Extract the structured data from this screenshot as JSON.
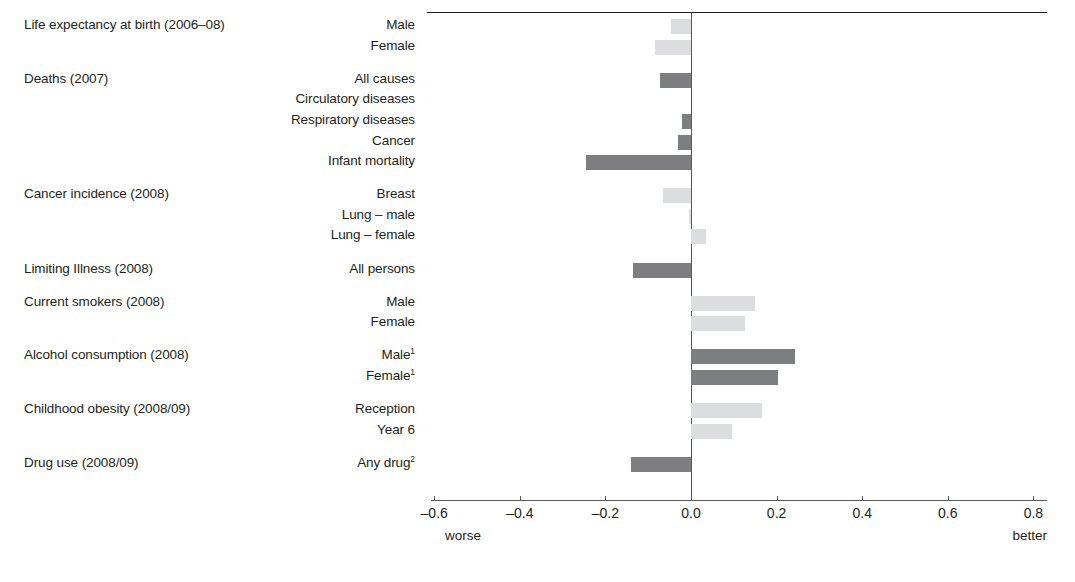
{
  "chart_data": {
    "type": "bar",
    "orientation": "horizontal",
    "title": "",
    "xlabel": "",
    "ylabel": "",
    "xlim": [
      -0.6,
      0.8
    ],
    "xticks": [
      -0.6,
      -0.4,
      -0.2,
      0.0,
      0.2,
      0.4,
      0.6,
      0.8
    ],
    "xtick_labels": [
      "–0.6",
      "–0.4",
      "–0.2",
      "0.0",
      "0.2",
      "0.4",
      "0.6",
      "0.8"
    ],
    "grid": false,
    "legend": null,
    "axis_end_labels": {
      "left": "worse",
      "right": "better"
    },
    "colors": {
      "dark": "#7d7e80",
      "light": "#dcdddf",
      "zero_line": "#58595b",
      "axis": "#58595b",
      "text": "#231f20"
    },
    "groups": [
      {
        "label": "Life expectancy at birth (2006–08)",
        "items": [
          {
            "label": "Male",
            "value": -0.047,
            "shade": "light"
          },
          {
            "label": "Female",
            "value": -0.084,
            "shade": "light"
          }
        ]
      },
      {
        "label": "Deaths (2007)",
        "items": [
          {
            "label": "All causes",
            "value": -0.072,
            "shade": "dark"
          },
          {
            "label": "Circulatory diseases",
            "value": 0.0,
            "shade": "dark"
          },
          {
            "label": "Respiratory diseases",
            "value": -0.021,
            "shade": "dark"
          },
          {
            "label": "Cancer",
            "value": -0.031,
            "shade": "dark"
          },
          {
            "label": "Infant mortality",
            "value": -0.245,
            "shade": "dark"
          }
        ]
      },
      {
        "label": "Cancer incidence (2008)",
        "items": [
          {
            "label": "Breast",
            "value": -0.065,
            "shade": "light"
          },
          {
            "label": "Lung – male",
            "value": -0.004,
            "shade": "light"
          },
          {
            "label": "Lung – female",
            "value": 0.035,
            "shade": "light"
          }
        ]
      },
      {
        "label": "Limiting Illness (2008)",
        "items": [
          {
            "label": "All persons",
            "value": -0.135,
            "shade": "dark"
          }
        ]
      },
      {
        "label": "Current smokers (2008)",
        "items": [
          {
            "label": "Male",
            "value": 0.149,
            "shade": "light"
          },
          {
            "label": "Female",
            "value": 0.125,
            "shade": "light"
          }
        ]
      },
      {
        "label": "Alcohol consumption (2008)",
        "items": [
          {
            "label": "Male",
            "sup": "1",
            "value": 0.243,
            "shade": "dark"
          },
          {
            "label": "Female",
            "sup": "1",
            "value": 0.203,
            "shade": "dark"
          }
        ]
      },
      {
        "label": "Childhood obesity (2008/09)",
        "items": [
          {
            "label": "Reception",
            "value": 0.165,
            "shade": "light"
          },
          {
            "label": "Year 6",
            "value": 0.095,
            "shade": "light"
          }
        ]
      },
      {
        "label": "Drug use (2008/09)",
        "items": [
          {
            "label": "Any drug",
            "sup": "2",
            "value": -0.14,
            "shade": "dark"
          }
        ]
      }
    ]
  }
}
